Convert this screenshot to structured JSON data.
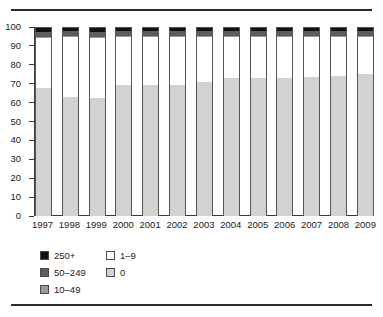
{
  "chart_data": {
    "type": "bar",
    "subtype": "stacked-100-percent",
    "title": "",
    "xlabel": "",
    "ylabel": "",
    "ylim": [
      0,
      100
    ],
    "yticks": [
      0,
      10,
      20,
      30,
      40,
      50,
      60,
      70,
      80,
      90,
      100
    ],
    "ytick_labels": [
      "0",
      "10",
      "20",
      "30",
      "40",
      "50",
      "60",
      "70",
      "80",
      "90",
      "100"
    ],
    "grid": false,
    "legend_position": "below-axes-left",
    "categories": [
      "1997",
      "1998",
      "1999",
      "2000",
      "2001",
      "2002",
      "2003",
      "2004",
      "2005",
      "2006",
      "2007",
      "2008",
      "2009"
    ],
    "stack_order_bottom_to_top": [
      "0",
      "1-9",
      "10-49",
      "50-249",
      "250+"
    ],
    "series": [
      {
        "name": "0",
        "label": "0",
        "color": "#d2d2d0",
        "values": [
          68,
          63.5,
          63,
          69.5,
          69.5,
          69.5,
          71.5,
          73.5,
          73.5,
          73.5,
          74,
          74.5,
          75.5
        ]
      },
      {
        "name": "1-9",
        "label": "1–9",
        "color": "#ffffff",
        "values": [
          26.5,
          31.5,
          31.5,
          25.5,
          25.5,
          25.5,
          23.5,
          21.5,
          21.5,
          21.5,
          21,
          20.5,
          19.5
        ]
      },
      {
        "name": "10-49",
        "label": "10–49",
        "color": "#9a9a9a",
        "values": [
          0.7,
          0.7,
          0.7,
          0.7,
          0.7,
          0.7,
          0.7,
          0.7,
          0.7,
          0.7,
          0.7,
          0.7,
          0.7
        ]
      },
      {
        "name": "50-249",
        "label": "50–249",
        "color": "#5e5e5e",
        "values": [
          2.8,
          2.8,
          2.8,
          2.8,
          2.8,
          2.8,
          2.8,
          2.8,
          2.8,
          2.8,
          2.8,
          2.8,
          2.8
        ]
      },
      {
        "name": "250+",
        "label": "250+",
        "color": "#111111",
        "values": [
          2.0,
          1.5,
          2.0,
          1.5,
          1.5,
          1.5,
          1.5,
          1.5,
          1.5,
          1.5,
          1.5,
          1.5,
          1.5
        ]
      }
    ]
  },
  "legend": {
    "left_column": [
      {
        "label": "250+",
        "color": "#111111"
      },
      {
        "label": "50–249",
        "color": "#5e5e5e"
      },
      {
        "label": "10–49",
        "color": "#9a9a9a"
      }
    ],
    "right_column": [
      {
        "label": "1–9",
        "color": "#ffffff"
      },
      {
        "label": "0",
        "color": "#d2d2d0"
      }
    ]
  }
}
